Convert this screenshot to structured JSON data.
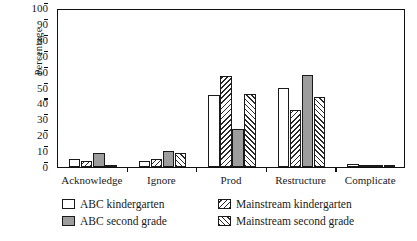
{
  "chart_data": {
    "type": "bar",
    "title": "",
    "xlabel": "",
    "ylabel": "Percentage",
    "ylim": [
      0,
      100
    ],
    "yticks": [
      0,
      10,
      20,
      30,
      40,
      50,
      60,
      70,
      80,
      90,
      100
    ],
    "grid": false,
    "legend_position": "below-axes",
    "categories": [
      "Acknowledge",
      "Ignore",
      "Prod",
      "Restructure",
      "Complicate"
    ],
    "series": [
      {
        "name": "ABC kindergarten",
        "pattern": "open",
        "color": "#ffffff",
        "values": [
          5,
          4,
          45,
          50,
          2
        ]
      },
      {
        "name": "Mainstream kindergarten",
        "pattern": "backslash-hatch",
        "color": "#ffffff",
        "values": [
          4,
          5,
          57,
          36,
          0
        ]
      },
      {
        "name": "ABC second grade",
        "pattern": "solid-gray",
        "color": "#9d9d9d",
        "values": [
          9,
          10,
          24,
          58,
          1
        ]
      },
      {
        "name": "Mainstream second grade",
        "pattern": "forwardslash-hatch",
        "color": "#ffffff",
        "values": [
          1,
          9,
          46,
          44,
          1
        ]
      }
    ]
  },
  "axis": {
    "y_label": "Percentage",
    "y_ticks": [
      "0",
      "10",
      "20",
      "30",
      "40",
      "50",
      "60",
      "70",
      "80",
      "90",
      "100"
    ],
    "x_categories": [
      "Acknowledge",
      "Ignore",
      "Prod",
      "Restructure",
      "Complicate"
    ]
  },
  "legend": {
    "column_one": [
      {
        "label": "ABC kindergarten",
        "swatch": "open"
      },
      {
        "label": "ABC second grade",
        "swatch": "solid-gray"
      }
    ],
    "column_two": [
      {
        "label": "Mainstream kindergarten",
        "swatch": "backslash-hatch"
      },
      {
        "label": "Mainstream second grade",
        "swatch": "forwardslash-hatch"
      }
    ]
  }
}
